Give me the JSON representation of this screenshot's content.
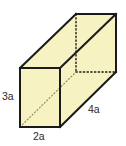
{
  "figure": {
    "name": "rectangular-prism-diagram",
    "shape": "rectangular prism",
    "fill_color": "#F6F2C2",
    "edge_color": "#1A1A1A",
    "hidden_edge_style": "dotted",
    "background_color": "#FFFFFF",
    "labels": {
      "height": "3a",
      "width": "2a",
      "depth": "4a"
    },
    "dimensions": {
      "height_expression": "3a",
      "width_expression": "2a",
      "depth_expression": "4a"
    },
    "geometry": {
      "front_top_left": [
        20,
        68
      ],
      "front_top_right": [
        60,
        68
      ],
      "front_bottom_right": [
        60,
        127
      ],
      "front_bottom_left": [
        20,
        127
      ],
      "back_top_left": [
        76,
        14
      ],
      "back_top_right": [
        116,
        14
      ],
      "back_bottom_right": [
        116,
        72
      ],
      "back_bottom_left": [
        76,
        72
      ]
    },
    "visible_faces": [
      "front",
      "top",
      "right"
    ],
    "hidden_edges": [
      "back-left-vertical",
      "back-top-left-horizontal",
      "back-bottom-horizontal",
      "front-bottom-left-to-back-bottom-left"
    ]
  }
}
